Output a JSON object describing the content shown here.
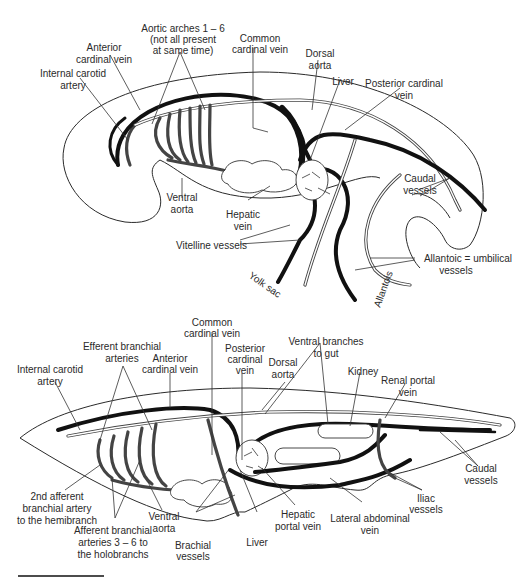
{
  "top_diagram": {
    "name": "Embryo circulatory system",
    "labels": {
      "aortic_arches_1": "Aortic arches 1 – 6",
      "aortic_arches_2": "(not all present",
      "aortic_arches_3": "at same time)",
      "anterior_cardinal_1": "Anterior",
      "anterior_cardinal_2": "cardinal vein",
      "internal_carotid_1": "Internal carotid",
      "internal_carotid_2": "artery",
      "common_cardinal_1": "Common",
      "common_cardinal_2": "cardinal vein",
      "dorsal_aorta_1": "Dorsal",
      "dorsal_aorta_2": "aorta",
      "liver": "Liver",
      "posterior_cardinal_1": "Posterior cardinal",
      "posterior_cardinal_2": "vein",
      "ventral_aorta_1": "Ventral",
      "ventral_aorta_2": "aorta",
      "hepatic_vein_1": "Hepatic",
      "hepatic_vein_2": "vein",
      "vitelline": "Vitelline vessels",
      "caudal_1": "Caudal",
      "caudal_2": "vessels",
      "allantoic_1": "Allantoic = umbilical",
      "allantoic_2": "vessels",
      "yolk_sac": "Yolk sac",
      "allantois": "Allantois"
    }
  },
  "bottom_diagram": {
    "name": "Adult fish circulatory system",
    "labels": {
      "common_cardinal_1": "Common",
      "common_cardinal_2": "cardinal vein",
      "efferent_1": "Efferent branchial",
      "efferent_2": "arteries",
      "anterior_cardinal_1": "Anterior",
      "anterior_cardinal_2": "cardinal vein",
      "posterior_cardinal_1": "Posterior",
      "posterior_cardinal_2": "cardinal",
      "posterior_cardinal_3": "vein",
      "dorsal_aorta_1": "Dorsal",
      "dorsal_aorta_2": "aorta",
      "ventral_branches_1": "Ventral branches",
      "ventral_branches_2": "to gut",
      "kidney": "Kidney",
      "renal_portal_1": "Renal portal",
      "renal_portal_2": "vein",
      "internal_carotid_1": "Internal carotid",
      "internal_carotid_2": "artery",
      "caudal_1": "Caudal",
      "caudal_2": "vessels",
      "iliac_1": "Iliac",
      "iliac_2": "vessels",
      "second_afferent_1": "2nd afferent",
      "second_afferent_2": "branchial artery",
      "second_afferent_3": "to the hemibranch",
      "ventral_aorta_1": "Ventral",
      "ventral_aorta_2": "aorta",
      "afferent_1": "Afferent branchial",
      "afferent_2": "arteries 3 – 6 to",
      "afferent_3": "the holobranchs",
      "brachial_1": "Brachial",
      "brachial_2": "vessels",
      "liver": "Liver",
      "hepatic_portal_1": "Hepatic",
      "hepatic_portal_2": "portal vein",
      "lateral_abdominal_1": "Lateral abdominal",
      "lateral_abdominal_2": "vein"
    }
  }
}
